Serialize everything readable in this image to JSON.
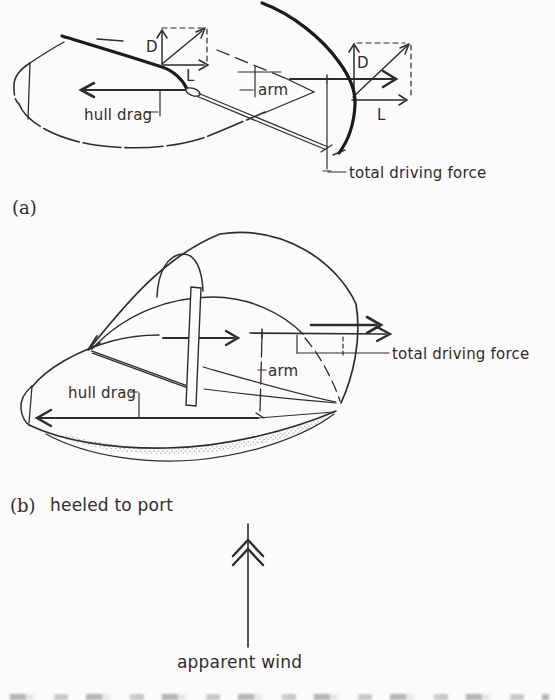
{
  "colors": {
    "ink": "#2d2d2d",
    "ink_heavy": "#1b1b1b",
    "paper": "#fcfbf9"
  },
  "panel_a": {
    "caption": "(a)",
    "vector_labels": {
      "drag_left": "D",
      "lift_left": "L",
      "drag_right": "D",
      "lift_right": "L"
    },
    "hull_drag_label": "hull drag",
    "arm_label": "arm",
    "total_driving_force_label": "total driving force"
  },
  "panel_b": {
    "caption_marker": "(b)",
    "caption_text": "heeled to port",
    "hull_drag_label": "hull drag",
    "arm_label": "arm",
    "total_driving_force_label": "total driving force"
  },
  "wind": {
    "label": "apparent wind"
  }
}
